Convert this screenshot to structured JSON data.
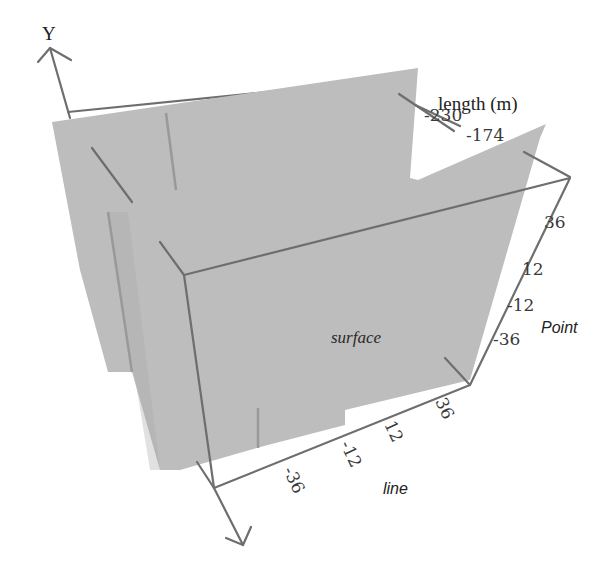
{
  "figure": {
    "colors": {
      "surface_fill": "#b9b9b9",
      "axis_line": "#6e6e6e",
      "background": "#ffffff"
    },
    "axes": {
      "y_axis": {
        "label": "Y"
      },
      "length_axis": {
        "label": "length (m)",
        "ticks": [
          "-230",
          "-174"
        ]
      },
      "point_axis": {
        "label": "Point",
        "ticks": [
          "36",
          "12",
          "-12",
          "-36"
        ]
      },
      "line_axis": {
        "label": "line",
        "ticks": [
          "-36",
          "-12",
          "12",
          "36"
        ]
      }
    },
    "surface_label": "surface"
  }
}
